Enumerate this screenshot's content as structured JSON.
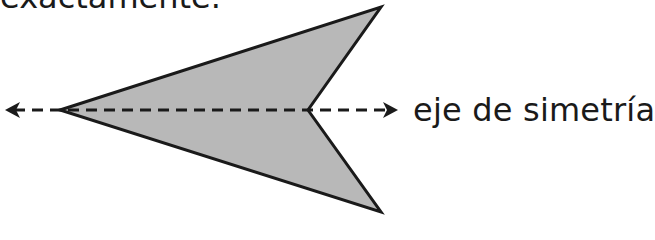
{
  "header": {
    "partial_text": "exactamente."
  },
  "figure": {
    "shape": "arrowhead-polygon",
    "fill_color": "#b8b8b8",
    "stroke_color": "#1a1a1a",
    "vertices": [
      [
        60,
        110
      ],
      [
        381,
        7
      ],
      [
        308,
        110
      ],
      [
        381,
        212
      ]
    ],
    "axis": {
      "from": [
        5,
        110
      ],
      "to": [
        397,
        110
      ],
      "style": "dashed",
      "arrows": "both"
    }
  },
  "labels": {
    "axis_label": "eje de simetría"
  }
}
